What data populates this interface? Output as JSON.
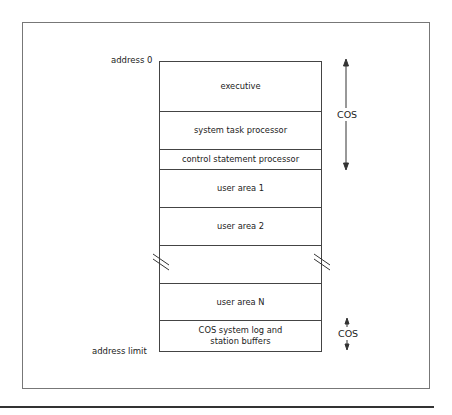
{
  "diagram": {
    "address_start_label": "address  0",
    "address_end_label": "address limit",
    "regions": [
      {
        "label": "executive"
      },
      {
        "label": "system task processor"
      },
      {
        "label": "control statement processor"
      },
      {
        "label": "user area 1"
      },
      {
        "label": "user area 2"
      },
      {
        "label": ""
      },
      {
        "label": "user area N"
      },
      {
        "label": "COS system log and station buffers"
      }
    ],
    "brackets": [
      {
        "label": "COS",
        "spans": [
          "executive",
          "system task processor",
          "control statement processor"
        ]
      },
      {
        "label": "COS",
        "spans": [
          "COS system log and station buffers"
        ]
      }
    ],
    "break_marker": "discontinuity between user area 2 and user area N"
  }
}
